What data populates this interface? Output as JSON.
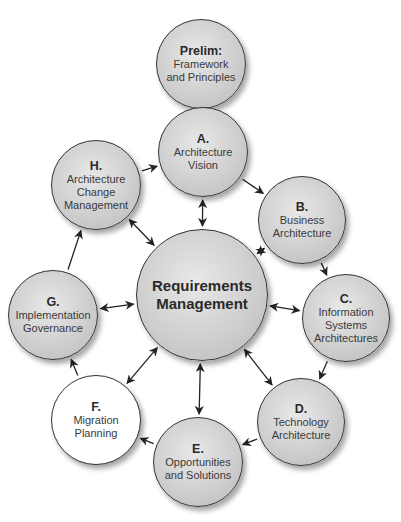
{
  "diagram": {
    "nodes": [
      {
        "id": "prelim",
        "letter": "Prelim:",
        "label": "Framework and Principles",
        "cx": 201,
        "cy": 64,
        "r": 45,
        "fill": "gray"
      },
      {
        "id": "a",
        "letter": "A.",
        "label": "Architecture Vision",
        "cx": 203,
        "cy": 152,
        "r": 45,
        "fill": "gray"
      },
      {
        "id": "b",
        "letter": "B.",
        "label": "Business Architecture",
        "cx": 302,
        "cy": 220,
        "r": 44,
        "fill": "gray"
      },
      {
        "id": "c",
        "letter": "C.",
        "label": "Information Systems Architectures",
        "cx": 346,
        "cy": 318,
        "r": 44,
        "fill": "gray"
      },
      {
        "id": "d",
        "letter": "D.",
        "label": "Technology Architecture",
        "cx": 301,
        "cy": 422,
        "r": 44,
        "fill": "gray"
      },
      {
        "id": "e",
        "letter": "E.",
        "label": "Opportunities and Solutions",
        "cx": 198,
        "cy": 462,
        "r": 45,
        "fill": "gray"
      },
      {
        "id": "f",
        "letter": "F.",
        "label": "Migration Planning",
        "cx": 96,
        "cy": 420,
        "r": 45,
        "fill": "white"
      },
      {
        "id": "g",
        "letter": "G.",
        "label": "Implementation Governance",
        "cx": 53,
        "cy": 315,
        "r": 45,
        "fill": "gray"
      },
      {
        "id": "h",
        "letter": "H.",
        "label": "Architecture Change Management",
        "cx": 96,
        "cy": 185,
        "r": 45,
        "fill": "gray"
      },
      {
        "id": "req",
        "letter": "",
        "label": "Requirements Management",
        "cx": 202,
        "cy": 295,
        "r": 66,
        "fill": "gray"
      }
    ],
    "edges": [
      {
        "from": "prelim",
        "to": "a",
        "type": "one-way"
      },
      {
        "from": "a",
        "to": "b",
        "type": "one-way"
      },
      {
        "from": "b",
        "to": "c",
        "type": "one-way"
      },
      {
        "from": "c",
        "to": "d",
        "type": "one-way"
      },
      {
        "from": "d",
        "to": "e",
        "type": "one-way"
      },
      {
        "from": "e",
        "to": "f",
        "type": "one-way"
      },
      {
        "from": "f",
        "to": "g",
        "type": "one-way"
      },
      {
        "from": "g",
        "to": "h",
        "type": "one-way"
      },
      {
        "from": "h",
        "to": "a",
        "type": "one-way"
      },
      {
        "from": "req",
        "to": "a",
        "type": "two-way"
      },
      {
        "from": "req",
        "to": "b",
        "type": "two-way"
      },
      {
        "from": "req",
        "to": "c",
        "type": "two-way"
      },
      {
        "from": "req",
        "to": "d",
        "type": "two-way"
      },
      {
        "from": "req",
        "to": "e",
        "type": "two-way"
      },
      {
        "from": "req",
        "to": "f",
        "type": "two-way"
      },
      {
        "from": "req",
        "to": "g",
        "type": "two-way"
      },
      {
        "from": "req",
        "to": "h",
        "type": "two-way"
      }
    ],
    "colors": {
      "stroke": "#333333",
      "gray_fill": "#cfcfcf",
      "white_fill": "#ffffff",
      "arrow": "#222222"
    }
  }
}
